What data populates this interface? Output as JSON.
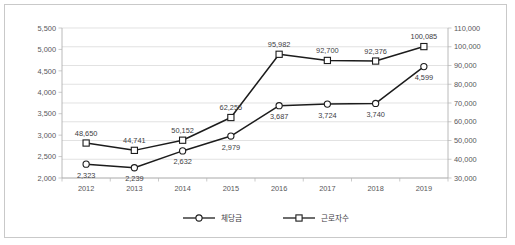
{
  "chart_data": {
    "type": "line",
    "title": "",
    "xlabel": "",
    "ylabel": "",
    "grid": "horizontal",
    "legend_position": "bottom",
    "categories": [
      "2012",
      "2013",
      "2014",
      "2015",
      "2016",
      "2017",
      "2018",
      "2019"
    ],
    "series": [
      {
        "name": "체당금",
        "axis": "left",
        "marker": "circle",
        "color": "#1c1c1c",
        "label_position": "below",
        "values": [
          2323,
          2239,
          2632,
          2979,
          3687,
          3724,
          3740,
          4599
        ],
        "value_labels": [
          "2,323",
          "2,239",
          "2,632",
          "2,979",
          "3,687",
          "3,724",
          "3,740",
          "4,599"
        ]
      },
      {
        "name": "근로자수",
        "axis": "right",
        "marker": "square",
        "color": "#1c1c1c",
        "label_position": "above",
        "values": [
          48650,
          44741,
          50152,
          62255,
          95982,
          92700,
          92376,
          100085
        ],
        "value_labels": [
          "48,650",
          "44,741",
          "50,152",
          "62,255",
          "95,982",
          "92,700",
          "92,376",
          "100,085"
        ]
      }
    ],
    "y_left": {
      "ylim": [
        2000,
        5500
      ],
      "ticks": [
        2000,
        2500,
        3000,
        3500,
        4000,
        4500,
        5000,
        5500
      ],
      "tick_labels": [
        "2,000",
        "2,500",
        "3,000",
        "3,500",
        "4,000",
        "4,500",
        "5,000",
        "5,500"
      ]
    },
    "y_right": {
      "ylim": [
        30000,
        110000
      ],
      "ticks": [
        30000,
        40000,
        50000,
        60000,
        70000,
        80000,
        90000,
        100000,
        110000
      ],
      "tick_labels": [
        "30,000",
        "40,000",
        "50,000",
        "60,000",
        "70,000",
        "80,000",
        "90,000",
        "100,000",
        "110,000"
      ]
    },
    "legend": [
      {
        "label": "체당금",
        "marker": "circle"
      },
      {
        "label": "근로자수",
        "marker": "square"
      }
    ]
  }
}
